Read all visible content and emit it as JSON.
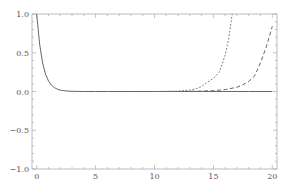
{
  "chart_data": {
    "type": "line",
    "title": "",
    "xlabel": "",
    "ylabel": "",
    "xlim": [
      -0.4,
      20.4
    ],
    "ylim": [
      -1.0,
      1.0
    ],
    "grid": false,
    "legend": null,
    "frame": true,
    "x_ticks": [
      0,
      5,
      10,
      15,
      20
    ],
    "x_tick_labels": [
      "0",
      "5",
      "10",
      "15",
      "20"
    ],
    "y_ticks": [
      -1.0,
      -0.5,
      0.0,
      0.5,
      1.0
    ],
    "y_tick_labels": [
      "−1.0",
      "−0.5",
      "0.0",
      "0.5",
      "1.0"
    ],
    "series": [
      {
        "name": "solid",
        "style": "solid",
        "color": "#666666",
        "x": [
          0,
          0.25,
          0.5,
          0.75,
          1.0,
          1.25,
          1.5,
          1.75,
          2.0,
          2.5,
          3.0,
          3.5,
          4.0,
          5.0,
          6.0,
          8.0,
          10.0,
          12.0,
          14.0,
          16.0,
          18.0,
          20.0
        ],
        "y": [
          1.0,
          0.607,
          0.368,
          0.223,
          0.135,
          0.082,
          0.05,
          0.03,
          0.018,
          0.007,
          0.002,
          0.001,
          0.0,
          0.0,
          0.0,
          0.0,
          0.0,
          0.0,
          0.0,
          0.0,
          0.0,
          0.0
        ]
      },
      {
        "name": "dotted",
        "style": "dotted",
        "color": "#777777",
        "x": [
          10.0,
          11.0,
          12.0,
          13.0,
          13.5,
          14.0,
          14.5,
          15.0,
          15.5,
          16.0,
          16.3,
          16.6
        ],
        "y": [
          0.0,
          0.002,
          0.005,
          0.018,
          0.034,
          0.064,
          0.12,
          0.17,
          0.25,
          0.47,
          0.68,
          1.0
        ]
      },
      {
        "name": "dashed",
        "style": "dashed",
        "color": "#666666",
        "x": [
          12.0,
          13.0,
          14.0,
          15.0,
          16.0,
          17.0,
          17.5,
          18.0,
          18.5,
          19.0,
          19.5,
          20.0
        ],
        "y": [
          0.0,
          0.002,
          0.005,
          0.01,
          0.024,
          0.056,
          0.085,
          0.13,
          0.2,
          0.37,
          0.58,
          0.84
        ]
      }
    ]
  }
}
